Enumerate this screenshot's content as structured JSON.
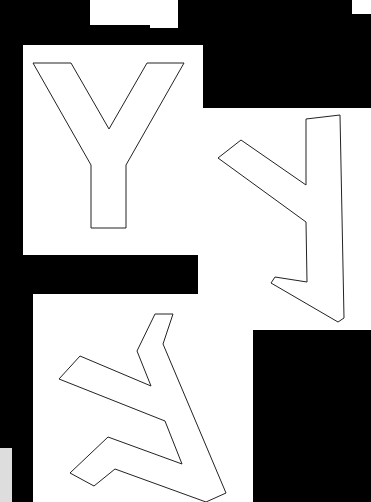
{
  "scene": {
    "description": "Three white paper cards on a black background, each showing an outlined letter Y at different rotations",
    "background_color": "#000000",
    "card_color": "#ffffff",
    "outline_color": "#222222"
  },
  "cards": [
    {
      "letter": "Y",
      "rotation": "upright"
    },
    {
      "letter": "Y",
      "rotation": "rotated ~90° counter-clockwise"
    },
    {
      "letter": "Y",
      "rotation": "rotated ~120°"
    }
  ]
}
